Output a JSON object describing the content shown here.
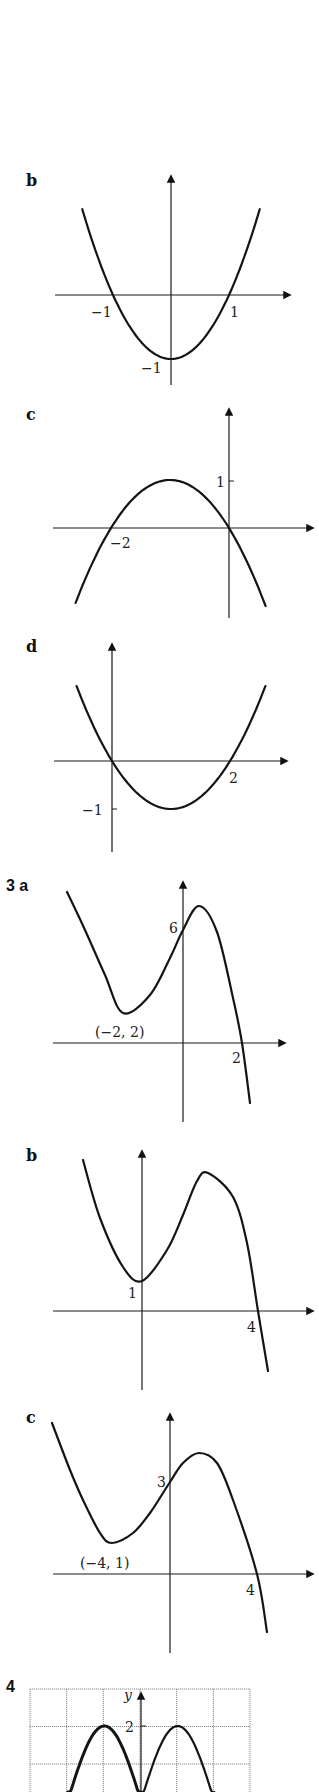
{
  "chart_data": [
    {
      "id": "2b",
      "type": "line",
      "label": "b",
      "title": "Graph of y = x² − 1",
      "function": {
        "kind": "quadratic",
        "coefficients": [
          1,
          0,
          -1
        ],
        "domain": [
          -1.53,
          1.53
        ]
      },
      "x_intercepts": [
        -1,
        1
      ],
      "y_intercept": -1,
      "labels": {
        "x_left": "−1",
        "x_right": "1",
        "y": "−1"
      },
      "grid": false
    },
    {
      "id": "2c",
      "type": "line",
      "label": "c",
      "title": "Graph of y = −x² − 2x",
      "function": {
        "kind": "quadratic",
        "coefficients": [
          -1,
          -2,
          0
        ],
        "domain": [
          -2.6,
          0.62
        ]
      },
      "x_intercepts": [
        -2,
        0
      ],
      "turning_point": [
        -1,
        1
      ],
      "labels": {
        "x_left": "−2",
        "y": "1"
      },
      "grid": false
    },
    {
      "id": "2d",
      "type": "line",
      "label": "d",
      "title": "Graph of y = x² − 2x",
      "function": {
        "kind": "quadratic",
        "coefficients": [
          1,
          -2,
          0
        ],
        "domain": [
          -0.6,
          2.6
        ]
      },
      "x_intercepts": [
        0,
        2
      ],
      "turning_point": [
        1,
        -1
      ],
      "labels": {
        "x_right": "2",
        "y": "−1"
      },
      "grid": false
    },
    {
      "id": "3a",
      "type": "line",
      "label": "3 a",
      "title": "Cubic with minimum (−2, 2)",
      "y_intercept": 6,
      "x_intercepts": [
        2
      ],
      "turning_points": [
        [
          -2,
          2
        ]
      ],
      "labels": {
        "point": "(−2, 2)",
        "y": "6",
        "x_right": "2"
      },
      "path_px": [
        [
          67,
          892
        ],
        [
          85,
          930
        ],
        [
          105,
          975
        ],
        [
          123,
          1013
        ],
        [
          150,
          995
        ],
        [
          170,
          958
        ],
        [
          183,
          930
        ],
        [
          199,
          906
        ],
        [
          217,
          932
        ],
        [
          233,
          998
        ],
        [
          242,
          1043
        ],
        [
          250,
          1103
        ]
      ],
      "grid": false
    },
    {
      "id": "3b",
      "type": "line",
      "label": "b",
      "title": "Cubic with minimum on y-axis",
      "y_intercept": 1,
      "x_intercepts": [
        4
      ],
      "labels": {
        "y": "1",
        "x_right": "4"
      },
      "path_px": [
        [
          83,
          1160
        ],
        [
          100,
          1218
        ],
        [
          123,
          1267
        ],
        [
          142,
          1281
        ],
        [
          167,
          1250
        ],
        [
          183,
          1215
        ],
        [
          197,
          1181
        ],
        [
          208,
          1173
        ],
        [
          233,
          1197
        ],
        [
          247,
          1243
        ],
        [
          258,
          1311
        ],
        [
          268,
          1371
        ]
      ],
      "grid": false
    },
    {
      "id": "3c",
      "type": "line",
      "label": "c",
      "title": "Cubic with minimum (−4, 1)",
      "y_intercept": 3,
      "x_intercepts": [
        4
      ],
      "turning_points": [
        [
          -4,
          1
        ]
      ],
      "labels": {
        "point": "(−4, 1)",
        "y": "3",
        "x_right": "4"
      },
      "path_px": [
        [
          52,
          1423
        ],
        [
          70,
          1470
        ],
        [
          83,
          1500
        ],
        [
          100,
          1533
        ],
        [
          112,
          1543
        ],
        [
          133,
          1533
        ],
        [
          150,
          1513
        ],
        [
          170,
          1482
        ],
        [
          183,
          1463
        ],
        [
          199,
          1453
        ],
        [
          217,
          1463
        ],
        [
          233,
          1500
        ],
        [
          257,
          1574
        ],
        [
          267,
          1632
        ]
      ],
      "grid": false
    },
    {
      "id": "4",
      "type": "line",
      "label": "4",
      "title": "Graph of y = 2|sin x| on grid",
      "function": {
        "kind": "abs_sine",
        "amplitude": 2,
        "domain": [
          -3.1416,
          3.1416
        ]
      },
      "ylabel": "y",
      "labels": {
        "y_tick": "2"
      },
      "grid": true,
      "grid_columns": 6,
      "maxima": [
        [
          -1.5708,
          2
        ],
        [
          1.5708,
          2
        ]
      ]
    }
  ]
}
